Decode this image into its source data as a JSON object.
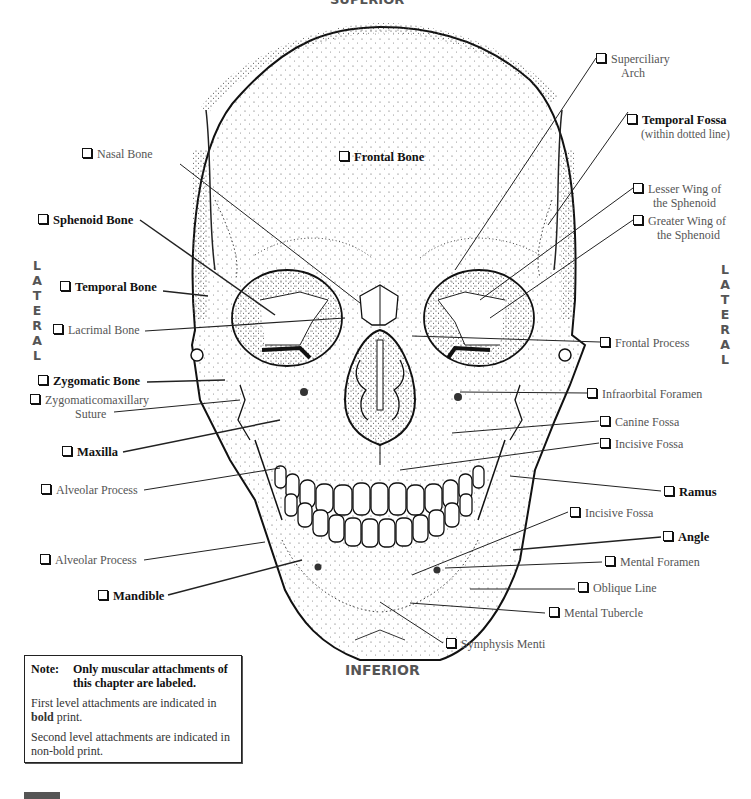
{
  "orientation": {
    "top": "SUPERIOR",
    "bottom": "INFERIOR",
    "left": [
      "L",
      "A",
      "T",
      "E",
      "R",
      "A",
      "L"
    ],
    "right": [
      "L",
      "A",
      "T",
      "E",
      "R",
      "A",
      "L"
    ]
  },
  "labels": {
    "frontal_bone": {
      "text": "Frontal Bone",
      "level": "first"
    },
    "superciliary_arch": {
      "line1": "Superciliary",
      "line2": "Arch",
      "level": "second"
    },
    "temporal_fossa": {
      "line1": "Temporal Fossa",
      "line2": "(within dotted line)",
      "level": "first"
    },
    "nasal_bone": {
      "text": "Nasal Bone",
      "level": "second"
    },
    "lesser_wing": {
      "line1": "Lesser Wing of",
      "line2": "the Sphenoid",
      "level": "second"
    },
    "greater_wing": {
      "line1": "Greater Wing of",
      "line2": "the Sphenoid",
      "level": "second"
    },
    "sphenoid_bone": {
      "text": "Sphenoid Bone",
      "level": "first"
    },
    "temporal_bone": {
      "text": "Temporal Bone",
      "level": "first"
    },
    "lacrimal_bone": {
      "text": "Lacrimal Bone",
      "level": "second"
    },
    "frontal_process": {
      "text": "Frontal Process",
      "level": "second"
    },
    "zygomatic_bone": {
      "text": "Zygomatic Bone",
      "level": "first"
    },
    "zygomaticomaxillary_suture": {
      "line1": "Zygomaticomaxillary",
      "line2": "Suture",
      "level": "second"
    },
    "infraorbital_foramen": {
      "text": "Infraorbital Foramen",
      "level": "second"
    },
    "canine_fossa": {
      "text": "Canine Fossa",
      "level": "second"
    },
    "maxilla": {
      "text": "Maxilla",
      "level": "first"
    },
    "incisive_fossa_upper": {
      "text": "Incisive Fossa",
      "level": "second"
    },
    "alveolar_process_upper": {
      "text": "Alveolar Process",
      "level": "second"
    },
    "ramus": {
      "text": "Ramus",
      "level": "first"
    },
    "incisive_fossa_lower": {
      "text": "Incisive Fossa",
      "level": "second"
    },
    "angle": {
      "text": "Angle",
      "level": "first"
    },
    "alveolar_process_lower": {
      "text": "Alveolar Process",
      "level": "second"
    },
    "mental_foramen": {
      "text": "Mental Foramen",
      "level": "second"
    },
    "mandible": {
      "text": "Mandible",
      "level": "first"
    },
    "oblique_line": {
      "text": "Oblique Line",
      "level": "second"
    },
    "mental_tubercle": {
      "text": "Mental Tubercle",
      "level": "second"
    },
    "symphysis_menti": {
      "text": "Symphysis Menti",
      "level": "second"
    }
  },
  "note": {
    "key": "Note:",
    "heading": "Only muscular attachments of this chapter are labeled.",
    "para1_pre": "First level attachments are indicated in ",
    "para1_bold": "bold",
    "para1_post": " print.",
    "para2": "Second level attachments are indicated in non-bold print."
  }
}
